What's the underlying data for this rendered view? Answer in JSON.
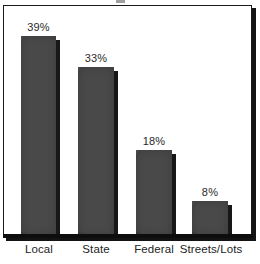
{
  "chart_data": {
    "type": "bar",
    "title": "",
    "xlabel": "",
    "ylabel": "",
    "categories": [
      "Local",
      "State",
      "Federal",
      "Streets/Lots"
    ],
    "values": [
      39,
      33,
      18,
      8
    ],
    "value_labels": [
      "39%",
      "33%",
      "18%",
      "8%"
    ],
    "ylim": [
      0,
      48
    ],
    "grid": false,
    "legend": false,
    "units": "percent",
    "orientation": "vertical",
    "series": [
      {
        "name": "Share",
        "values": [
          39,
          33,
          18,
          8
        ]
      }
    ],
    "colors": {
      "bar_fill": "#474747",
      "bar_shadow": "#171717",
      "axis": "#0d0d0d",
      "frame": "#1b1b1b",
      "plot_background": "#ffffff",
      "value_label": "#2a2a2a",
      "category_label": "#232323"
    }
  },
  "bars": [
    {
      "category": "Local",
      "value_label": "39%",
      "left_px": 17,
      "width_px": 35,
      "height_px": 199,
      "center_px": 38
    },
    {
      "category": "State",
      "value_label": "33%",
      "left_px": 74,
      "width_px": 36,
      "height_px": 168,
      "center_px": 95
    },
    {
      "category": "Federal",
      "value_label": "18%",
      "left_px": 132,
      "width_px": 36,
      "height_px": 85,
      "center_px": 153
    },
    {
      "category": "Streets/Lots",
      "value_label": "8%",
      "left_px": 188,
      "width_px": 36,
      "height_px": 34,
      "center_px": 209
    }
  ],
  "category_axis": [
    {
      "label": "Local",
      "center_px": 39
    },
    {
      "label": "State",
      "center_px": 96
    },
    {
      "label": "Federal",
      "center_px": 154
    },
    {
      "label": "Streets/Lots",
      "center_px": 211
    }
  ]
}
